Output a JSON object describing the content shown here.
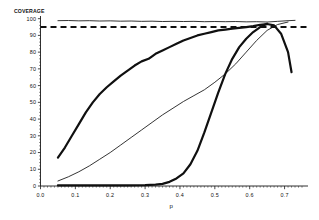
{
  "chart_data": {
    "type": "line",
    "title": "",
    "ylabel": "COVERAGE",
    "xlabel": "p",
    "xlim": [
      0.0,
      0.75
    ],
    "ylim": [
      0,
      101
    ],
    "grid": false,
    "legend": "none",
    "y_ticks": [
      0,
      10,
      20,
      30,
      40,
      50,
      60,
      70,
      80,
      90,
      100
    ],
    "y_tick_labels": [
      "0",
      "10",
      "20",
      "30",
      "40",
      "50",
      "60",
      "70",
      "80",
      "90",
      "100"
    ],
    "x_ticks": [
      0.0,
      0.1,
      0.2,
      0.3,
      0.4,
      0.5,
      0.6,
      0.7
    ],
    "x_tick_labels": [
      "0.0",
      "0.1",
      "0.2",
      "0.3",
      "0.4",
      "0.5",
      "0.6",
      "0.7"
    ],
    "annotations": [
      {
        "name": "nominal-level-reference",
        "kind": "horizontal-dashed-line",
        "value": 95,
        "label": ""
      }
    ],
    "series": [
      {
        "name": "upper-flat-curve",
        "style": "thin-solid",
        "x": [
          0.05,
          0.08,
          0.11,
          0.14,
          0.17,
          0.2,
          0.23,
          0.26,
          0.29,
          0.32,
          0.35,
          0.38,
          0.41,
          0.44,
          0.47,
          0.5,
          0.53,
          0.56,
          0.59,
          0.62,
          0.65,
          0.68,
          0.71,
          0.73
        ],
        "values": [
          98.8,
          98.9,
          98.7,
          98.8,
          98.6,
          98.7,
          98.5,
          98.6,
          98.4,
          98.5,
          98.3,
          98.4,
          98.3,
          98.4,
          98.2,
          98.3,
          98.2,
          98.3,
          98.1,
          98.2,
          98.0,
          98.4,
          98.8,
          99.0
        ]
      },
      {
        "name": "fast-rising-thick-curve",
        "style": "thick-solid",
        "x": [
          0.05,
          0.07,
          0.09,
          0.11,
          0.13,
          0.15,
          0.17,
          0.19,
          0.21,
          0.23,
          0.25,
          0.27,
          0.29,
          0.31,
          0.33,
          0.35,
          0.37,
          0.39,
          0.41,
          0.43,
          0.45,
          0.47,
          0.49,
          0.51,
          0.53,
          0.55,
          0.57,
          0.59,
          0.61,
          0.63,
          0.65,
          0.67,
          0.69,
          0.71,
          0.72
        ],
        "values": [
          17.0,
          23.0,
          30.0,
          37.0,
          44.0,
          50.0,
          55.0,
          59.0,
          62.5,
          66.0,
          69.0,
          72.0,
          74.5,
          76.0,
          79.0,
          81.0,
          83.0,
          85.0,
          87.0,
          88.5,
          90.0,
          91.0,
          92.0,
          93.0,
          93.5,
          94.0,
          94.5,
          95.0,
          95.6,
          96.3,
          96.8,
          96.0,
          91.0,
          80.0,
          68.0
        ]
      },
      {
        "name": "mid-rising-thin-curve",
        "style": "thin-solid",
        "x": [
          0.05,
          0.08,
          0.11,
          0.14,
          0.17,
          0.2,
          0.23,
          0.26,
          0.29,
          0.32,
          0.35,
          0.38,
          0.41,
          0.44,
          0.47,
          0.5,
          0.53,
          0.56,
          0.59,
          0.62,
          0.65,
          0.68,
          0.71
        ],
        "values": [
          3.0,
          5.5,
          8.5,
          12.0,
          16.0,
          20.0,
          24.5,
          29.0,
          33.5,
          38.0,
          42.5,
          46.5,
          50.5,
          54.0,
          57.5,
          62.0,
          67.0,
          73.0,
          80.0,
          87.0,
          93.0,
          96.5,
          98.0
        ]
      },
      {
        "name": "late-rising-thick-curve",
        "style": "thick-solid",
        "x": [
          0.05,
          0.1,
          0.15,
          0.2,
          0.25,
          0.3,
          0.33,
          0.35,
          0.37,
          0.39,
          0.41,
          0.43,
          0.45,
          0.47,
          0.49,
          0.51,
          0.53,
          0.55,
          0.57,
          0.59,
          0.61,
          0.63,
          0.65
        ],
        "values": [
          0.4,
          0.4,
          0.4,
          0.4,
          0.4,
          0.5,
          0.8,
          1.3,
          2.5,
          4.5,
          7.5,
          13.0,
          21.0,
          32.0,
          44.0,
          56.0,
          67.0,
          76.0,
          83.0,
          88.0,
          92.0,
          95.0,
          97.0
        ]
      }
    ]
  }
}
